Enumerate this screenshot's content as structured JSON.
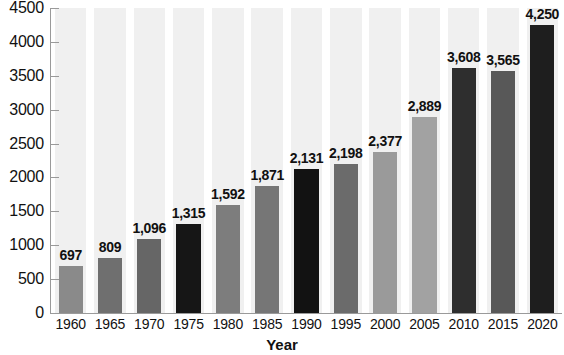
{
  "chart_data": {
    "type": "bar",
    "title": "",
    "subtitle": "",
    "xlabel": "Year",
    "ylabel": "",
    "categories": [
      "1960",
      "1965",
      "1970",
      "1975",
      "1980",
      "1985",
      "1990",
      "1995",
      "2000",
      "2005",
      "2010",
      "2015",
      "2020"
    ],
    "values": [
      697,
      809,
      1096,
      1315,
      1592,
      1871,
      2131,
      2198,
      2377,
      2889,
      3608,
      3565,
      4250
    ],
    "value_labels": [
      "697",
      "809",
      "1,096",
      "1,315",
      "1,592",
      "1,871",
      "2,131",
      "2,198",
      "2,377",
      "2,889",
      "3,608",
      "3,565",
      "4,250"
    ],
    "bar_colors": [
      "#8a8a8a",
      "#6f6f6f",
      "#666666",
      "#161616",
      "#7d7d7d",
      "#767676",
      "#121212",
      "#6b6b6b",
      "#9a9a9a",
      "#a2a2a2",
      "#2e2e2e",
      "#585858",
      "#1e1e1e"
    ],
    "ylim": [
      0,
      4500
    ],
    "ytick_labels": [
      "0",
      "500",
      "1000",
      "1500",
      "2000",
      "2500",
      "3000",
      "3500",
      "4000",
      "4500"
    ],
    "ytick_values": [
      0,
      500,
      1000,
      1500,
      2000,
      2500,
      3000,
      3500,
      4000,
      4500
    ],
    "grid": false,
    "legend": null,
    "legend_position": "none",
    "band_color": "#f0f0f0",
    "axis_color": "#9a9a9a",
    "background": "#ffffff"
  }
}
